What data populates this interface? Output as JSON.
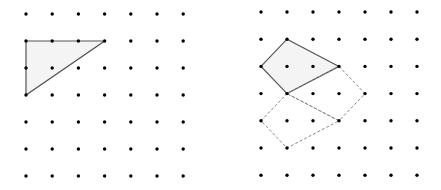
{
  "figures": [
    {
      "name": "left-grid",
      "origin": [
        26,
        14
      ],
      "spacing": [
        26.2,
        27
      ],
      "cols": 7,
      "rows": 7,
      "polygons": [
        {
          "name": "triangle",
          "points": [
            [
              0,
              1
            ],
            [
              3,
              1
            ],
            [
              0,
              3
            ]
          ],
          "style": "solid",
          "fill": "#f4f4f4"
        }
      ]
    },
    {
      "name": "right-grid",
      "origin": [
        261,
        12
      ],
      "spacing": [
        26,
        27.2
      ],
      "cols": 7,
      "rows": 7,
      "polygons": [
        {
          "name": "quadrilateral",
          "points": [
            [
              0,
              2
            ],
            [
              1,
              1
            ],
            [
              3,
              2
            ],
            [
              1,
              3
            ]
          ],
          "style": "solid",
          "fill": "#f4f4f4"
        },
        {
          "name": "rotated-copy-1",
          "points": [
            [
              3,
              2
            ],
            [
              4,
              3
            ],
            [
              3,
              4
            ],
            [
              1,
              3
            ]
          ],
          "style": "dashed",
          "fill": "none"
        },
        {
          "name": "rotated-copy-2",
          "points": [
            [
              1,
              3
            ],
            [
              3,
              4
            ],
            [
              1,
              5
            ],
            [
              0,
              4
            ]
          ],
          "style": "dashed",
          "fill": "none"
        }
      ]
    }
  ],
  "colors": {
    "dot": "#000000",
    "line": "#555555",
    "dashed": "#888888"
  }
}
